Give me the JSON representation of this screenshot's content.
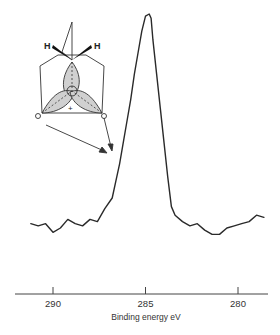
{
  "chart_data": {
    "type": "line",
    "title": "",
    "xlabel": "Binding energy eV",
    "ylabel": "",
    "xlim": [
      292,
      278.5
    ],
    "x_reversed": true,
    "grid": false,
    "legend": null,
    "xticks": [
      290,
      285,
      280
    ],
    "xtick_labels": [
      "290",
      "285",
      "280"
    ],
    "series": [
      {
        "name": "C 1s photoelectron spectrum",
        "note": "relative intensity (arbitrary units, 0 = baseline, 100 = peak)",
        "x": [
          291.2,
          290.8,
          290.4,
          290.0,
          289.6,
          289.2,
          288.8,
          288.4,
          288.0,
          287.6,
          287.2,
          286.8,
          286.6,
          286.4,
          286.2,
          286.0,
          285.8,
          285.6,
          285.4,
          285.2,
          285.0,
          284.8,
          284.7,
          284.6,
          284.4,
          284.2,
          284.0,
          283.8,
          283.6,
          283.4,
          283.0,
          282.6,
          282.2,
          281.8,
          281.4,
          281.0,
          280.6,
          280.2,
          279.8,
          279.4,
          279.0,
          278.6
        ],
        "values": [
          2,
          1,
          2,
          -2,
          0,
          4,
          2,
          1,
          4,
          3,
          9,
          14,
          22,
          30,
          40,
          50,
          60,
          72,
          82,
          92,
          99,
          100,
          98,
          88,
          72,
          56,
          40,
          24,
          10,
          6,
          3,
          1,
          2,
          -1,
          -3,
          -3,
          0,
          1,
          2,
          3,
          6,
          5
        ]
      }
    ],
    "annotations": [
      {
        "type": "inset_diagram",
        "description": "Molecular orbital diagram: tetrahedral carbon with two H atoms (wedge bonds) and three shaded lobes labelled +",
        "labels": [
          "H",
          "H",
          "+"
        ]
      },
      {
        "type": "arrows",
        "description": "Two arrows from the inset diagram pointing to the shoulder on the high-binding-energy side of the peak (~286.5 eV)"
      }
    ]
  },
  "inset": {
    "h_left": "H",
    "h_right": "H",
    "plus": "+"
  }
}
